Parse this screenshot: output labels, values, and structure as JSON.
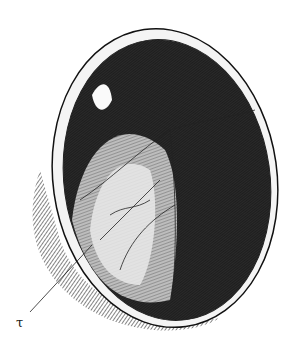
{
  "figure": {
    "label": "τ",
    "colors": {
      "ink": "#111111",
      "paper": "#ffffff",
      "mid": "#6a6a6a",
      "light": "#d8d8d8"
    }
  }
}
